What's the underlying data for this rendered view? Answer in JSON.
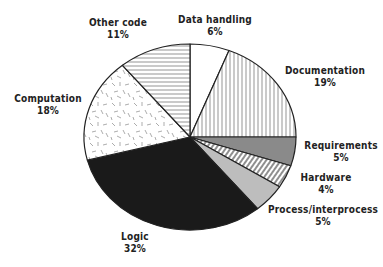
{
  "chart_data": {
    "type": "pie",
    "title": "",
    "start_angle_deg": 0,
    "direction": "clockwise",
    "slices": [
      {
        "label": "Data handling",
        "value": 6,
        "display": "6%",
        "fill": "blank"
      },
      {
        "label": "Documentation",
        "value": 19,
        "display": "19%",
        "fill": "vertical-lines"
      },
      {
        "label": "Requirements",
        "value": 5,
        "display": "5%",
        "fill": "dark-gray"
      },
      {
        "label": "Hardware",
        "value": 4,
        "display": "4%",
        "fill": "diagonal-lines"
      },
      {
        "label": "Process/interprocess",
        "value": 5,
        "display": "5%",
        "fill": "light-gray"
      },
      {
        "label": "Logic",
        "value": 32,
        "display": "32%",
        "fill": "black"
      },
      {
        "label": "Computation",
        "value": 18,
        "display": "18%",
        "fill": "dashes"
      },
      {
        "label": "Other code",
        "value": 11,
        "display": "11%",
        "fill": "horizontal-lines"
      }
    ],
    "categories": [
      "Data handling",
      "Documentation",
      "Requirements",
      "Hardware",
      "Process/interprocess",
      "Logic",
      "Computation",
      "Other code"
    ],
    "values": [
      6,
      19,
      5,
      4,
      5,
      32,
      18,
      11
    ],
    "units": "%"
  },
  "colors": {
    "outline": "#222222",
    "dark_gray": "#8a8a8a",
    "light_gray": "#bdbdbd",
    "black": "#1a1a1a",
    "hatch": "#555555"
  },
  "labels": {
    "data_handling": {
      "name": "Data handling",
      "pct": "6%"
    },
    "documentation": {
      "name": "Documentation",
      "pct": "19%"
    },
    "requirements": {
      "name": "Requirements",
      "pct": "5%"
    },
    "hardware": {
      "name": "Hardware",
      "pct": "4%"
    },
    "process": {
      "name": "Process/interprocess",
      "pct": "5%"
    },
    "logic": {
      "name": "Logic",
      "pct": "32%"
    },
    "computation": {
      "name": "Computation",
      "pct": "18%"
    },
    "other_code": {
      "name": "Other code",
      "pct": "11%"
    }
  }
}
